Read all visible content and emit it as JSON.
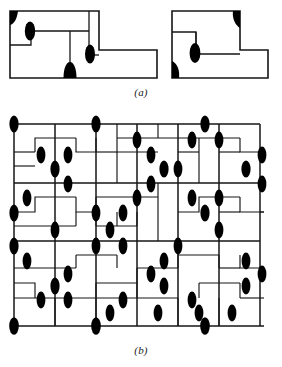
{
  "figure": {
    "background_color": "#ffffff",
    "line_color": "#161616",
    "node_color": "#000000",
    "width_px": 282,
    "height_px": 367
  },
  "panels": [
    {
      "id": "a",
      "caption": "(a)",
      "description": "Two separate outlined polyomino tile shapes, each containing black elliptical node markers on their edges and corners.",
      "shapes": [
        {
          "name": "left-tile",
          "node_count": 4,
          "nodes": [
            {
              "kind": "corner-wedge",
              "x": 10,
              "y": 11
            },
            {
              "kind": "ellipse",
              "x": 30,
              "y": 30
            },
            {
              "kind": "ellipse",
              "x": 93,
              "y": 55
            },
            {
              "kind": "half-ellipse",
              "x": 70,
              "y": 71
            }
          ]
        },
        {
          "name": "right-tile",
          "node_count": 3,
          "nodes": [
            {
              "kind": "corner-wedge",
              "x": 237,
              "y": 12
            },
            {
              "kind": "ellipse",
              "x": 194,
              "y": 53
            },
            {
              "kind": "corner-wedge",
              "x": 175,
              "y": 71
            }
          ]
        }
      ]
    },
    {
      "id": "b",
      "caption": "(b)",
      "description": "A large rectangular lattice of horizontal and vertical line segments with black elliptical node markers placed at many edge midpoints and intersections.",
      "grid": {
        "columns_x": [
          14,
          55,
          96,
          137,
          178,
          219,
          260
        ],
        "rows_y": [
          16,
          44,
          75,
          103,
          133,
          160,
          190,
          218
        ],
        "cell_width": 41,
        "cell_height": 28,
        "node_count": 61
      }
    }
  ],
  "captions": {
    "a": "(a)",
    "b": "(b)"
  }
}
